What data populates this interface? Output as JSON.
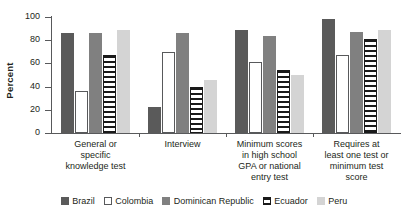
{
  "chart_data": {
    "type": "bar",
    "title": "",
    "xlabel": "",
    "ylabel": "Percent",
    "ylim": [
      0,
      100
    ],
    "yticks": [
      0,
      20,
      40,
      60,
      80,
      100
    ],
    "grid": false,
    "legend_position": "bottom",
    "categories": [
      "General or specific knowledge test",
      "Interview",
      "Minimum scores in high school GPA or national entry test",
      "Requires at least one test or minimum test score"
    ],
    "category_lines": [
      [
        "General or",
        "specific",
        "knowledge test"
      ],
      [
        "Interview"
      ],
      [
        "Minimum scores",
        "in high school",
        "GPA or national",
        "entry test"
      ],
      [
        "Requires at",
        "least one test or",
        "minimum test",
        "score"
      ]
    ],
    "series": [
      {
        "name": "Brazil",
        "color": "#5a5a5a",
        "values": [
          86,
          22,
          89,
          98
        ]
      },
      {
        "name": "Colombia",
        "color": "#ffffff",
        "values": [
          36,
          70,
          61,
          67
        ]
      },
      {
        "name": "Dominican Republic",
        "color": "#808080",
        "values": [
          86,
          86,
          84,
          87
        ]
      },
      {
        "name": "Ecuador",
        "color": "#ffffff",
        "values": [
          67,
          40,
          54,
          81
        ]
      },
      {
        "name": "Peru",
        "color": "#d4d4d4",
        "values": [
          89,
          46,
          50,
          89
        ]
      }
    ]
  }
}
